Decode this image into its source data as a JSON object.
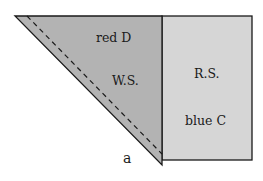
{
  "diagram": {
    "triangle": {
      "fill": "#b3b3b3",
      "labels": {
        "top": "red D",
        "middle": "W.S."
      }
    },
    "rectangle": {
      "fill": "#d6d6d6",
      "labels": {
        "top": "R.S.",
        "bottom": "blue C"
      }
    },
    "vertex_label": "a",
    "stroke": "#1a1a1a"
  }
}
